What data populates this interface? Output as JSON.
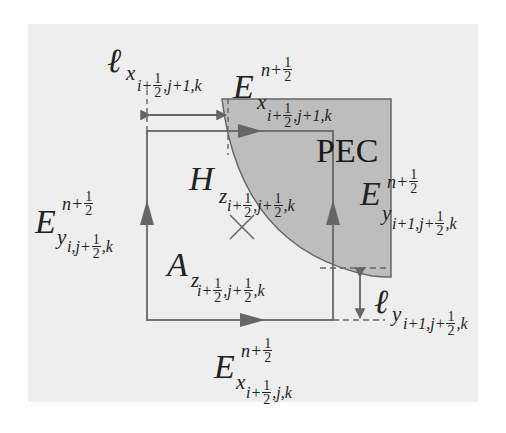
{
  "diagram": {
    "colors": {
      "background": "#ffffff",
      "panel": "#eeeeee",
      "pec_fill": "#bdbdbd",
      "line": "#666666",
      "text": "#222222"
    },
    "region_label": "PEC",
    "labels": {
      "lx_top": {
        "symbol": "ℓ",
        "sub": "x",
        "index_pre": "i+",
        "frac_num": "1",
        "frac_den": "2",
        "index_post": ",j+1,k"
      },
      "ex_top": {
        "symbol": "E",
        "sup_pre": "n+",
        "sup_num": "1",
        "sup_den": "2",
        "sub": "x",
        "index_pre": "i+",
        "frac_num": "1",
        "frac_den": "2",
        "index_post": ",j+1,k"
      },
      "hz": {
        "symbol": "H",
        "sub": "z",
        "index_pre": "i+",
        "frac1_num": "1",
        "frac1_den": "2",
        "index_mid": ",j+",
        "frac2_num": "1",
        "frac2_den": "2",
        "index_post": ",k"
      },
      "ey_left": {
        "symbol": "E",
        "sup_pre": "n+",
        "sup_num": "1",
        "sup_den": "2",
        "sub": "y",
        "index_pre": "i,j+",
        "frac_num": "1",
        "frac_den": "2",
        "index_post": ",k"
      },
      "ey_right": {
        "symbol": "E",
        "sup_pre": "n+",
        "sup_num": "1",
        "sup_den": "2",
        "sub": "y",
        "index_pre": "i+1,j+",
        "frac_num": "1",
        "frac_den": "2",
        "index_post": ",k"
      },
      "az": {
        "symbol": "A",
        "sub": "z",
        "index_pre": "i+",
        "frac1_num": "1",
        "frac1_den": "2",
        "index_mid": ",j+",
        "frac2_num": "1",
        "frac2_den": "2",
        "index_post": ",k"
      },
      "ly_right": {
        "symbol": "ℓ",
        "sub": "y",
        "index_pre": "i+1,j+",
        "frac_num": "1",
        "frac_den": "2",
        "index_post": ",k"
      },
      "ex_bottom": {
        "symbol": "E",
        "sup_pre": "n+",
        "sup_num": "1",
        "sup_den": "2",
        "sub": "x",
        "index_pre": "i+",
        "frac_num": "1",
        "frac_den": "2",
        "index_post": ",j,k"
      }
    },
    "marker": "cross"
  }
}
